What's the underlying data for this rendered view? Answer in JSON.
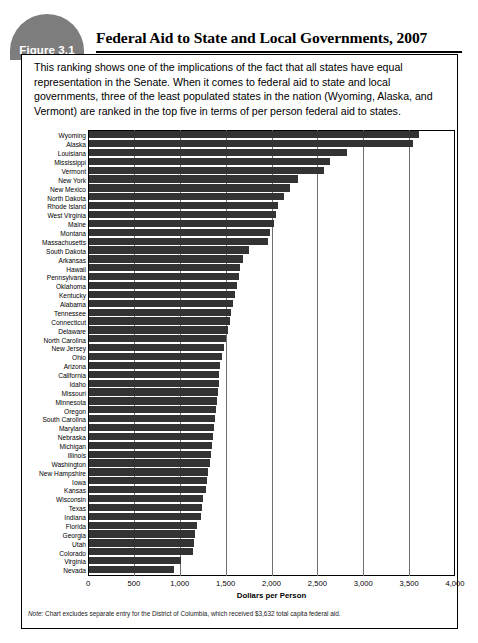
{
  "figure": {
    "badge_label": "Figure 3.1",
    "title": "Federal Aid to State and Local Governments, 2007",
    "badge_color": "#7d7d7d",
    "caption": "This ranking shows one of the implications of the fact that all states have equal representation in the Senate. When it comes to federal aid to state and local governments, three of the least populated states in the nation (Wyoming, Alaska, and Vermont) are ranked in the top five in terms of per person federal aid to states.",
    "note_prefix": "Note:",
    "note_text": " Chart excludes separate entry for the District of Columbia, which received $3,632 total capita federal aid."
  },
  "chart_data": {
    "type": "bar",
    "orientation": "horizontal",
    "title": "Federal Aid to State and Local Governments, 2007",
    "xlabel": "Dollars per Person",
    "ylabel": "",
    "xlim": [
      0,
      4000
    ],
    "xticks": [
      0,
      500,
      1000,
      1500,
      2000,
      2500,
      3000,
      3500,
      4000
    ],
    "xtick_labels": [
      "0",
      "500",
      "1,000",
      "1,500",
      "2,000",
      "2,500",
      "3,000",
      "3,500",
      "4,000"
    ],
    "grid": true,
    "legend": "none",
    "bar_color": "#333333",
    "categories": [
      "Wyoming",
      "Alaska",
      "Louisiana",
      "Mississippi",
      "Vermont",
      "New York",
      "New Mexico",
      "North Dakota",
      "Rhode Island",
      "West Virginia",
      "Maine",
      "Montana",
      "Massachusetts",
      "South Dakota",
      "Arkansas",
      "Hawaii",
      "Pennsylvania",
      "Oklahoma",
      "Kentucky",
      "Alabama",
      "Tennessee",
      "Connecticut",
      "Delaware",
      "North Carolina",
      "New Jersey",
      "Ohio",
      "Arizona",
      "California",
      "Idaho",
      "Missouri",
      "Minnesota",
      "Oregon",
      "South Carolina",
      "Maryland",
      "Nebraska",
      "Michigan",
      "Illinois",
      "Washington",
      "New Hampshire",
      "Iowa",
      "Kansas",
      "Wisconsin",
      "Texas",
      "Indiana",
      "Florida",
      "Georgia",
      "Utah",
      "Colorado",
      "Virginia",
      "Nevada"
    ],
    "values": [
      3620,
      3550,
      2830,
      2640,
      2570,
      2290,
      2200,
      2140,
      2070,
      2050,
      2030,
      1980,
      1960,
      1750,
      1690,
      1660,
      1640,
      1620,
      1600,
      1580,
      1560,
      1540,
      1520,
      1500,
      1480,
      1460,
      1440,
      1430,
      1420,
      1410,
      1400,
      1390,
      1380,
      1370,
      1360,
      1350,
      1340,
      1330,
      1300,
      1290,
      1280,
      1250,
      1240,
      1230,
      1180,
      1160,
      1150,
      1140,
      1010,
      930
    ]
  }
}
